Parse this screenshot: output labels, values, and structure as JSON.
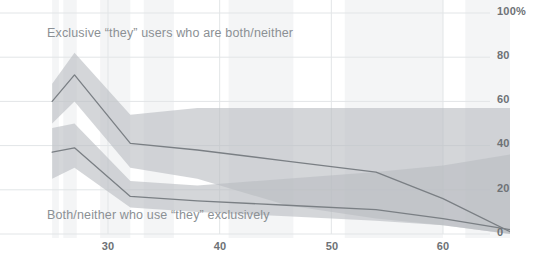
{
  "chart_data": {
    "type": "line",
    "title": "",
    "subtitle": "",
    "xlabel": "",
    "ylabel": "",
    "xlim": [
      25,
      66
    ],
    "ylim": [
      0,
      100
    ],
    "grid": true,
    "legend_position": "inline-annotations",
    "y_ticks": [
      0,
      20,
      40,
      60,
      80,
      100
    ],
    "y_tick_labels": [
      "0",
      "20",
      "40",
      "60",
      "80",
      "100%"
    ],
    "x_ticks": [
      30,
      40,
      50,
      60
    ],
    "x_tick_labels": [
      "30",
      "40",
      "50",
      "60"
    ],
    "annotations": [
      {
        "id": "annotation-upper",
        "text": "Exclusive “they” users who are both/neither"
      },
      {
        "id": "annotation-lower",
        "text": "Both/neither who use “they” exclusively"
      }
    ],
    "colors": {
      "line": "#7a7f84",
      "band": "#b9bdc1",
      "grid": "#e2e5e7",
      "stripe": "#f4f5f6",
      "tick_text": "#6e7276",
      "annotation_text": "#8b9094",
      "background": "#ffffff"
    },
    "x": [
      25,
      27,
      32,
      38,
      46,
      54,
      60,
      66
    ],
    "series": [
      {
        "name": "Exclusive “they” users who are both/neither",
        "values": [
          60,
          72,
          41,
          38,
          33,
          28,
          16,
          1
        ],
        "band_upper": [
          68,
          82,
          54,
          57,
          57,
          57,
          57,
          57
        ],
        "band_lower": [
          50,
          60,
          30,
          25,
          13,
          7,
          4,
          0
        ]
      },
      {
        "name": "Both/neither who use “they” exclusively",
        "values": [
          37,
          39,
          17,
          15,
          13,
          11,
          7,
          2
        ],
        "band_upper": [
          48,
          50,
          24,
          22,
          25,
          28,
          31,
          36
        ],
        "band_lower": [
          25,
          30,
          12,
          10,
          8,
          6,
          4,
          0
        ]
      }
    ],
    "stripes": [
      {
        "x_start": 25.0,
        "x_end": 25.6
      },
      {
        "x_start": 26.0,
        "x_end": 27.2
      },
      {
        "x_start": 29.3,
        "x_end": 32.0
      },
      {
        "x_start": 33.2,
        "x_end": 35.9
      },
      {
        "x_start": 40.8,
        "x_end": 46.6
      },
      {
        "x_start": 51.2,
        "x_end": 60.0
      },
      {
        "x_start": 62.0,
        "x_end": 66.0
      }
    ]
  }
}
